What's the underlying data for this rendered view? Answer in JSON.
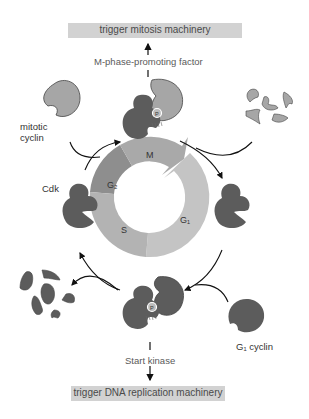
{
  "top_box": {
    "label": "trigger mitosis machinery"
  },
  "top_factor": {
    "label": "M-phase-promoting factor"
  },
  "bottom_box": {
    "label": "trigger DNA replication machinery"
  },
  "bottom_factor": {
    "label": "Start kinase"
  },
  "labels": {
    "mitotic_cyclin_line1": "mitotic",
    "mitotic_cyclin_line2": "cyclin",
    "cdk": "Cdk",
    "g1_cyclin": "G₁ cyclin",
    "phospho": "P"
  },
  "cycle": {
    "phases": [
      {
        "name": "M",
        "color": "#a9a9a9"
      },
      {
        "name": "G₁",
        "color": "#c4c4c4"
      },
      {
        "name": "S",
        "color": "#b3b3b3"
      },
      {
        "name": "G₂",
        "color": "#8e8e8e"
      }
    ]
  },
  "colors": {
    "cdk": "#5c5c5c",
    "cyclin": "#a6a6a6",
    "box": "#d2d2d2"
  }
}
